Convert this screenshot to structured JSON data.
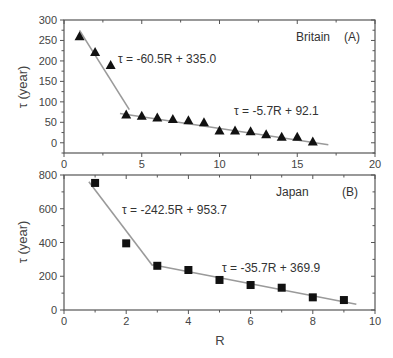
{
  "chart_data": [
    {
      "type": "scatter",
      "panel": "(A)",
      "title": "Britain",
      "xlabel": "",
      "ylabel": "τ (year)",
      "xlim": [
        0,
        20
      ],
      "ylim": [
        -25,
        300
      ],
      "xticks": [
        0,
        5,
        10,
        15,
        20
      ],
      "yticks": [
        0,
        50,
        100,
        150,
        200,
        250,
        300
      ],
      "grid": false,
      "marker": "triangle",
      "x": [
        1,
        2,
        3,
        4,
        5,
        6,
        7,
        8,
        9,
        10,
        11,
        12,
        13,
        14,
        15,
        16
      ],
      "values": [
        260,
        222,
        190,
        69,
        66,
        62,
        58,
        55,
        50,
        30,
        30,
        28,
        21,
        15,
        15,
        3
      ],
      "fits": [
        {
          "label": "τ = -60.5R + 335.0",
          "slope": -60.5,
          "intercept": 335.0,
          "x_range": [
            1.0,
            4.2
          ]
        },
        {
          "label": "τ = -5.7R + 92.1",
          "slope": -5.7,
          "intercept": 92.1,
          "x_range": [
            3.6,
            17.0
          ]
        }
      ]
    },
    {
      "type": "scatter",
      "panel": "(B)",
      "title": "Japan",
      "xlabel": "R",
      "ylabel": "τ (year)",
      "xlim": [
        0,
        10
      ],
      "ylim": [
        0,
        800
      ],
      "xticks": [
        0,
        2,
        4,
        6,
        8,
        10
      ],
      "yticks": [
        0,
        200,
        400,
        600,
        800
      ],
      "grid": false,
      "marker": "square",
      "x": [
        1,
        2,
        3,
        4,
        5,
        6,
        7,
        8,
        9
      ],
      "values": [
        753,
        395,
        262,
        237,
        178,
        148,
        132,
        75,
        59
      ],
      "fits": [
        {
          "label": "τ = -242.5R + 953.7",
          "slope": -242.5,
          "intercept": 953.7,
          "x_range": [
            0.8,
            2.85
          ]
        },
        {
          "label": "τ = -35.7R + 369.9",
          "slope": -35.7,
          "intercept": 369.9,
          "x_range": [
            2.85,
            9.4
          ]
        }
      ]
    }
  ],
  "labels": {
    "top_country": "Britain",
    "top_panel": "(A)",
    "top_fit1": "τ = -60.5R + 335.0",
    "top_fit2": "τ = -5.7R + 92.1",
    "top_ylabel": "τ (year)",
    "bottom_country": "Japan",
    "bottom_panel": "(B)",
    "bottom_fit1": "τ = -242.5R + 953.7",
    "bottom_fit2": "τ = -35.7R + 369.9",
    "bottom_ylabel": "τ (year)",
    "bottom_xlabel": "R"
  }
}
